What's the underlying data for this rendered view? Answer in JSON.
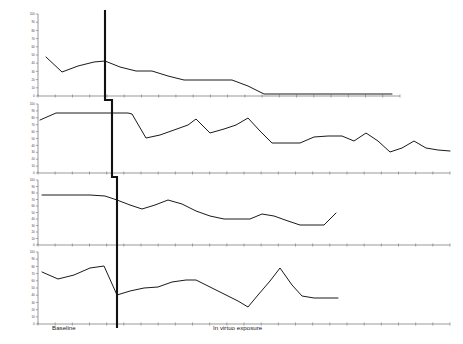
{
  "figure": {
    "background": "#ffffff",
    "line_color": "#1a1a1a",
    "axis_color": "#6e6e6e",
    "phase_line_color": "#111111",
    "width": 463,
    "height": 344
  },
  "axis": {
    "phase_labels": [
      {
        "text": "Baseline",
        "x": 52,
        "y": 330
      },
      {
        "text": "In virtuo exposure",
        "x": 213,
        "y": 330
      }
    ]
  },
  "chart_data": {
    "type": "line",
    "title": "",
    "xlabel": "Sessions",
    "ylabel": "",
    "grid": false,
    "legend": false,
    "design": "multiple-baseline across participants",
    "phases": [
      "Baseline",
      "In virtuo exposure"
    ],
    "panels": [
      {
        "name": "participant-1",
        "plot": {
          "x": 38,
          "y": 14,
          "w": 362,
          "h": 82
        },
        "phase_change_x": 105,
        "yticks": [
          0,
          10,
          20,
          30,
          40,
          50,
          60,
          70,
          80,
          90,
          100
        ],
        "ylim": [
          0,
          100
        ],
        "series": [
          {
            "name": "anxiety",
            "points": [
              [
                46,
                57
              ],
              [
                62,
                72
              ],
              [
                78,
                66
              ],
              [
                94,
                62
              ],
              [
                105,
                61
              ],
              [
                120,
                67
              ],
              [
                136,
                71
              ],
              [
                152,
                71
              ],
              [
                168,
                76
              ],
              [
                184,
                80
              ],
              [
                200,
                80
              ],
              [
                216,
                80
              ],
              [
                232,
                80
              ],
              [
                248,
                86
              ],
              [
                264,
                94
              ],
              [
                280,
                94
              ],
              [
                296,
                94
              ],
              [
                312,
                94
              ],
              [
                328,
                94
              ],
              [
                344,
                94
              ],
              [
                360,
                94
              ],
              [
                376,
                94
              ],
              [
                392,
                94
              ]
            ]
          }
        ]
      },
      {
        "name": "participant-2",
        "plot": {
          "x": 38,
          "y": 104,
          "w": 412,
          "h": 69
        },
        "phase_change_x": 112,
        "yticks": [
          0,
          10,
          20,
          30,
          40,
          50,
          60,
          70,
          80,
          90,
          100
        ],
        "ylim": [
          0,
          100
        ],
        "series": [
          {
            "name": "anxiety",
            "points": [
              [
                40,
                120
              ],
              [
                56,
                113
              ],
              [
                72,
                113
              ],
              [
                88,
                113
              ],
              [
                104,
                113
              ],
              [
                112,
                113
              ],
              [
                128,
                113
              ],
              [
                132,
                114
              ],
              [
                146,
                138
              ],
              [
                160,
                135
              ],
              [
                174,
                130
              ],
              [
                188,
                125
              ],
              [
                196,
                119
              ],
              [
                210,
                133
              ],
              [
                224,
                129
              ],
              [
                236,
                125
              ],
              [
                248,
                118
              ],
              [
                260,
                131
              ],
              [
                272,
                143
              ],
              [
                286,
                143
              ],
              [
                300,
                143
              ],
              [
                314,
                137
              ],
              [
                328,
                136
              ],
              [
                342,
                136
              ],
              [
                354,
                141
              ],
              [
                366,
                133
              ],
              [
                378,
                141
              ],
              [
                390,
                152
              ],
              [
                402,
                148
              ],
              [
                414,
                141
              ],
              [
                426,
                148
              ],
              [
                438,
                150
              ],
              [
                450,
                151
              ]
            ]
          }
        ]
      },
      {
        "name": "participant-3",
        "plot": {
          "x": 38,
          "y": 180,
          "w": 412,
          "h": 65
        },
        "phase_change_x": 117,
        "yticks": [
          0,
          10,
          20,
          30,
          40,
          50,
          60,
          70,
          80,
          90,
          100
        ],
        "ylim": [
          0,
          100
        ],
        "series": [
          {
            "name": "anxiety",
            "points": [
              [
                42,
                195
              ],
              [
                58,
                195
              ],
              [
                74,
                195
              ],
              [
                90,
                195
              ],
              [
                105,
                196
              ],
              [
                117,
                200
              ],
              [
                130,
                205
              ],
              [
                142,
                209
              ],
              [
                155,
                205
              ],
              [
                168,
                200
              ],
              [
                182,
                204
              ],
              [
                196,
                211
              ],
              [
                210,
                216
              ],
              [
                224,
                219
              ],
              [
                238,
                219
              ],
              [
                250,
                219
              ],
              [
                262,
                214
              ],
              [
                274,
                216
              ],
              [
                288,
                221
              ],
              [
                300,
                225
              ],
              [
                312,
                225
              ],
              [
                324,
                225
              ],
              [
                336,
                213
              ]
            ]
          }
        ]
      },
      {
        "name": "participant-4",
        "plot": {
          "x": 38,
          "y": 252,
          "w": 412,
          "h": 72
        },
        "phase_change_x": 117,
        "yticks": [
          0,
          10,
          20,
          30,
          40,
          50,
          60,
          70,
          80,
          90,
          100
        ],
        "ylim": [
          0,
          100
        ],
        "series": [
          {
            "name": "anxiety",
            "points": [
              [
                42,
                272
              ],
              [
                58,
                279
              ],
              [
                74,
                275
              ],
              [
                90,
                268
              ],
              [
                104,
                266
              ],
              [
                117,
                295
              ],
              [
                130,
                291
              ],
              [
                144,
                288
              ],
              [
                158,
                287
              ],
              [
                172,
                282
              ],
              [
                186,
                280
              ],
              [
                196,
                280
              ],
              [
                210,
                287
              ],
              [
                224,
                294
              ],
              [
                238,
                301
              ],
              [
                248,
                307
              ],
              [
                258,
                295
              ],
              [
                270,
                281
              ],
              [
                280,
                268
              ],
              [
                292,
                285
              ],
              [
                302,
                296
              ],
              [
                314,
                298
              ],
              [
                326,
                298
              ],
              [
                338,
                298
              ]
            ]
          }
        ]
      }
    ]
  }
}
